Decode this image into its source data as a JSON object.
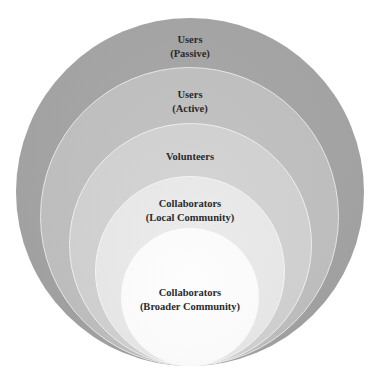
{
  "diagram": {
    "type": "nested-circles",
    "colors": {
      "background": "#ffffff",
      "ring_1": "#a2a2a2",
      "ring_2": "#bdbdbd",
      "ring_3": "#cfcfcf",
      "ring_4": "#e6e6e6",
      "ring_5": "#fafafa",
      "text": "#2a2a2a"
    },
    "layers": [
      {
        "id": "users-passive",
        "line1": "Users",
        "line2": "(Passive)"
      },
      {
        "id": "users-active",
        "line1": "Users",
        "line2": "(Active)"
      },
      {
        "id": "volunteers",
        "line1": "Volunteers",
        "line2": ""
      },
      {
        "id": "collaborators-local",
        "line1": "Collaborators",
        "line2": "(Local Community)"
      },
      {
        "id": "collaborators-broader",
        "line1": "Collaborators",
        "line2": "(Broader Community)"
      }
    ]
  }
}
